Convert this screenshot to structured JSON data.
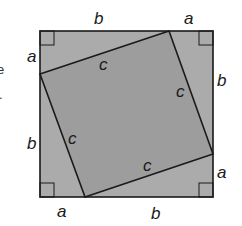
{
  "diagram": {
    "colors": {
      "outer_fill": "#ababab",
      "inner_fill": "#9d9d9d",
      "stroke": "#1a1a1a"
    },
    "outer_square": {
      "x": 40,
      "y": 31,
      "size": 173
    },
    "inner_square_vertices": [
      [
        40,
        74
      ],
      [
        169,
        31
      ],
      [
        213,
        154
      ],
      [
        85,
        197
      ]
    ],
    "labels": {
      "top_b": "b",
      "top_a": "a",
      "right_b": "b",
      "right_a": "a",
      "bottom_a": "a",
      "bottom_b": "b",
      "left_a": "a",
      "left_b": "b",
      "inner_top_c": "c",
      "inner_right_c": "c",
      "inner_left_c": "c",
      "inner_bottom_c": "c"
    },
    "left_edge_fragments": [
      "e",
      "."
    ]
  }
}
